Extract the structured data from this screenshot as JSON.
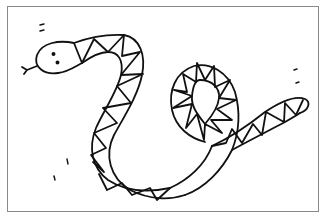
{
  "illustration": {
    "subject": "snake line drawing",
    "style": "black outline coloring page with triangle pattern",
    "colors": {
      "stroke": "#111111",
      "background": "#ffffff",
      "frame": "#8a8a8a"
    }
  }
}
